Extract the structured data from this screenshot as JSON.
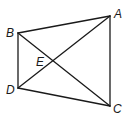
{
  "figure": {
    "type": "quadrilateral-with-diagonals",
    "points": {
      "A": {
        "label": "A",
        "x": 110,
        "y": 16
      },
      "B": {
        "label": "B",
        "x": 18,
        "y": 33
      },
      "C": {
        "label": "C",
        "x": 110,
        "y": 106
      },
      "D": {
        "label": "D",
        "x": 18,
        "y": 88
      },
      "E": {
        "label": "E",
        "x": 54,
        "y": 61
      }
    },
    "sides": [
      "BA",
      "AC",
      "CD",
      "DB"
    ],
    "diagonals": [
      "BC",
      "DA"
    ],
    "line_color": "#1a1a1a"
  }
}
